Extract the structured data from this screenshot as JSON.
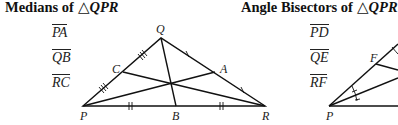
{
  "left_panel": {
    "title_prefix": "Medians of ",
    "title_triangle": "△",
    "title_name": "QPR",
    "segments": [
      "PA",
      "QB",
      "RC"
    ],
    "vertices": {
      "P": "P",
      "Q": "Q",
      "R": "R"
    },
    "points": {
      "A": "A",
      "B": "B",
      "C": "C"
    }
  },
  "right_panel": {
    "title_prefix": "Angle Bisectors of ",
    "title_triangle": "△",
    "title_name": "QPR",
    "segments": [
      "PD",
      "QE",
      "RF"
    ],
    "vertices": {
      "P": "P"
    },
    "points": {
      "F": "F"
    }
  },
  "colors": {
    "line": "#111111",
    "text": "#222222",
    "background": "#ffffff"
  }
}
